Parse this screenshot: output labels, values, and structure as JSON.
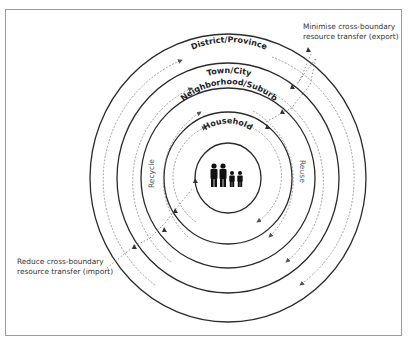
{
  "diagram": {
    "levels": [
      {
        "label": "National/Regional",
        "rx": 138,
        "ry": 144
      },
      {
        "label": "District/Province",
        "rx": 111,
        "ry": 115
      },
      {
        "label": "Town/City",
        "rx": 87,
        "ry": 90
      },
      {
        "label": "Neighborhood/Suburb",
        "rx": 64,
        "ry": 66
      },
      {
        "label": "Household",
        "rx": 33,
        "ry": 35
      }
    ],
    "center": {
      "x": 228,
      "y": 178
    },
    "flow_labels": {
      "left": "Recycle",
      "right": "Reuse"
    },
    "annotations": {
      "export_line1": "Minimise cross-boundary",
      "export_line2": "resource transfer (export)",
      "import_line1": "Reduce cross-boundary",
      "import_line2": "resource transfer (import)"
    },
    "center_icon": "family-icon",
    "colors": {
      "solid_line": "#2b2b2b",
      "dashed_line": "#8a8a8a",
      "text": "#222222",
      "frame": "#9a9a9a"
    }
  }
}
